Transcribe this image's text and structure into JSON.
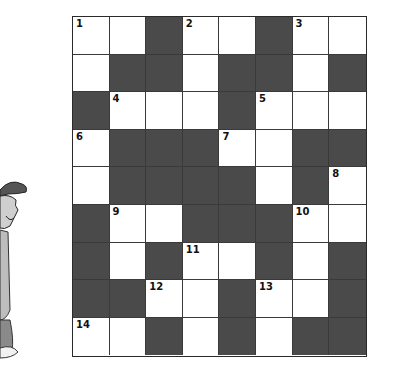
{
  "puzzle": {
    "rows": 9,
    "cols": 8,
    "colors": {
      "black": "#4a4a4a",
      "white": "#ffffff",
      "border": "#2a2a2a"
    },
    "grid": [
      [
        "W",
        "W",
        "B",
        "W",
        "W",
        "B",
        "W",
        "W"
      ],
      [
        "W",
        "B",
        "B",
        "W",
        "B",
        "B",
        "W",
        "B"
      ],
      [
        "B",
        "W",
        "W",
        "W",
        "B",
        "W",
        "W",
        "W"
      ],
      [
        "W",
        "B",
        "B",
        "B",
        "W",
        "W",
        "B",
        "B"
      ],
      [
        "W",
        "B",
        "B",
        "B",
        "B",
        "W",
        "B",
        "W"
      ],
      [
        "B",
        "W",
        "W",
        "B",
        "B",
        "B",
        "W",
        "W"
      ],
      [
        "B",
        "W",
        "B",
        "W",
        "W",
        "B",
        "W",
        "B"
      ],
      [
        "B",
        "B",
        "W",
        "W",
        "B",
        "W",
        "W",
        "B"
      ],
      [
        "W",
        "W",
        "B",
        "W",
        "B",
        "W",
        "B",
        "B"
      ]
    ],
    "numbers": [
      {
        "r": 0,
        "c": 0,
        "n": "1"
      },
      {
        "r": 0,
        "c": 3,
        "n": "2"
      },
      {
        "r": 0,
        "c": 6,
        "n": "3"
      },
      {
        "r": 2,
        "c": 1,
        "n": "4"
      },
      {
        "r": 2,
        "c": 5,
        "n": "5"
      },
      {
        "r": 3,
        "c": 0,
        "n": "6"
      },
      {
        "r": 3,
        "c": 4,
        "n": "7"
      },
      {
        "r": 4,
        "c": 7,
        "n": "8"
      },
      {
        "r": 5,
        "c": 1,
        "n": "9"
      },
      {
        "r": 5,
        "c": 6,
        "n": "10"
      },
      {
        "r": 6,
        "c": 3,
        "n": "11"
      },
      {
        "r": 7,
        "c": 2,
        "n": "12"
      },
      {
        "r": 7,
        "c": 5,
        "n": "13"
      },
      {
        "r": 8,
        "c": 0,
        "n": "14"
      }
    ]
  },
  "illustration": {
    "subject": "cartoon boy with cap (partially visible)"
  }
}
